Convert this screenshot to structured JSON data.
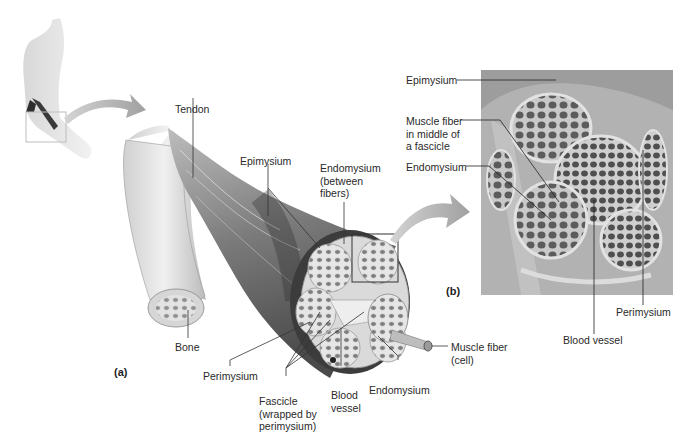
{
  "figure": {
    "panels": [
      {
        "id": "a",
        "label": "(a)"
      },
      {
        "id": "b",
        "label": "(b)"
      }
    ],
    "illustration_labels": {
      "tendon": "Tendon",
      "epimysium": "Epimysium",
      "endomysium_between": "Endomysium\n(between\nfibers)",
      "bone": "Bone",
      "perimysium": "Perimysium",
      "fascicle": "Fascicle\n(wrapped by\nperimysium)",
      "blood_vessel": "Blood\nvessel",
      "endomysium": "Endomysium",
      "muscle_fiber": "Muscle fiber\n(cell)"
    },
    "micrograph_labels": {
      "epimysium": "Epimysium",
      "muscle_fiber_middle": "Muscle fiber\nin middle of\na fascicle",
      "endomysium": "Endomysium",
      "perimysium": "Perimysium",
      "blood_vessel": "Blood vessel"
    },
    "colors": {
      "background": "#ffffff",
      "muscle_dark": "#4a4a4a",
      "muscle_light": "#c8c8c8",
      "arrow": "#a8a8a8",
      "micrograph_bg": "#b9b9b9",
      "fiber_dark": "#555555",
      "leader_line": "#333333"
    }
  }
}
